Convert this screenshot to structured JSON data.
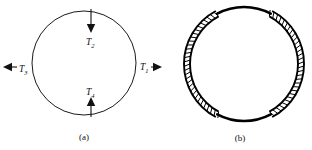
{
  "figure": {
    "background_color": "#ffffff",
    "line_color": "#111111",
    "width": 312,
    "height": 150,
    "panels": [
      {
        "id": "a",
        "caption": "(a)",
        "description": "thin circular ring with four tension force arrows",
        "circle": {
          "cx": 84,
          "cy": 63,
          "r": 52
        },
        "forces": [
          {
            "label": "T",
            "subscript": "1",
            "full_label": "T1",
            "direction": "right",
            "position": "right",
            "label_x": 140,
            "label_y": 70,
            "arrow_x1": 151,
            "arrow_y1": 67,
            "arrow_x2": 162,
            "arrow_y2": 67
          },
          {
            "label": "T",
            "subscript": "2",
            "full_label": "T2",
            "direction": "down",
            "position": "top",
            "label_x": 86,
            "label_y": 45,
            "arrow_x1": 91,
            "arrow_y1": 9,
            "arrow_x2": 91,
            "arrow_y2": 33
          },
          {
            "label": "T",
            "subscript": "3",
            "full_label": "T3",
            "direction": "left",
            "position": "left",
            "label_x": 19,
            "label_y": 72,
            "arrow_x1": 17,
            "arrow_y1": 67,
            "arrow_x2": 3,
            "arrow_y2": 67
          },
          {
            "label": "T",
            "subscript": "4",
            "full_label": "T4",
            "direction": "up",
            "position": "bottom",
            "label_x": 86,
            "label_y": 95,
            "arrow_x1": 91,
            "arrow_y1": 117,
            "arrow_x2": 91,
            "arrow_y2": 97
          }
        ]
      },
      {
        "id": "b",
        "caption": "(b)",
        "description": "thick circular ring with radial ladder hatching on the left and right arcs",
        "circle": {
          "cx": 244,
          "cy": 64,
          "r": 60
        },
        "ring_thickness": 6,
        "hatch_segments": [
          {
            "name": "left-hatched-arc",
            "start_angle_deg": 118,
            "end_angle_deg": 242,
            "tick_count": 30
          },
          {
            "name": "right-hatched-arc",
            "start_angle_deg": -62,
            "end_angle_deg": 62,
            "tick_count": 30
          }
        ],
        "plain_segments": [
          {
            "name": "top-plain-arc",
            "start_angle_deg": 62,
            "end_angle_deg": 118
          },
          {
            "name": "bottom-plain-arc",
            "start_angle_deg": 242,
            "end_angle_deg": 298
          }
        ]
      }
    ],
    "captions": [
      {
        "text": "(a)",
        "x": 84,
        "y": 140
      },
      {
        "text": "(b)",
        "x": 240,
        "y": 141
      }
    ]
  }
}
